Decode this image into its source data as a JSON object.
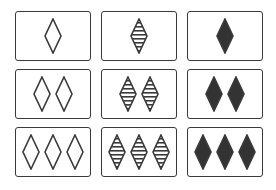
{
  "colors": {
    "stroke": "#3a3a3a",
    "fill": "#333333",
    "background": "#ffffff"
  },
  "shape": "diamond",
  "grid": {
    "rows": 3,
    "columns": 3,
    "row_variable": "count",
    "column_variable": "shading"
  },
  "cards": [
    {
      "row": 1,
      "col": 1,
      "count": 1,
      "shading": "open"
    },
    {
      "row": 1,
      "col": 2,
      "count": 1,
      "shading": "striped"
    },
    {
      "row": 1,
      "col": 3,
      "count": 1,
      "shading": "solid"
    },
    {
      "row": 2,
      "col": 1,
      "count": 2,
      "shading": "open"
    },
    {
      "row": 2,
      "col": 2,
      "count": 2,
      "shading": "striped"
    },
    {
      "row": 2,
      "col": 3,
      "count": 2,
      "shading": "solid"
    },
    {
      "row": 3,
      "col": 1,
      "count": 3,
      "shading": "open"
    },
    {
      "row": 3,
      "col": 2,
      "count": 3,
      "shading": "striped"
    },
    {
      "row": 3,
      "col": 3,
      "count": 3,
      "shading": "solid"
    }
  ]
}
